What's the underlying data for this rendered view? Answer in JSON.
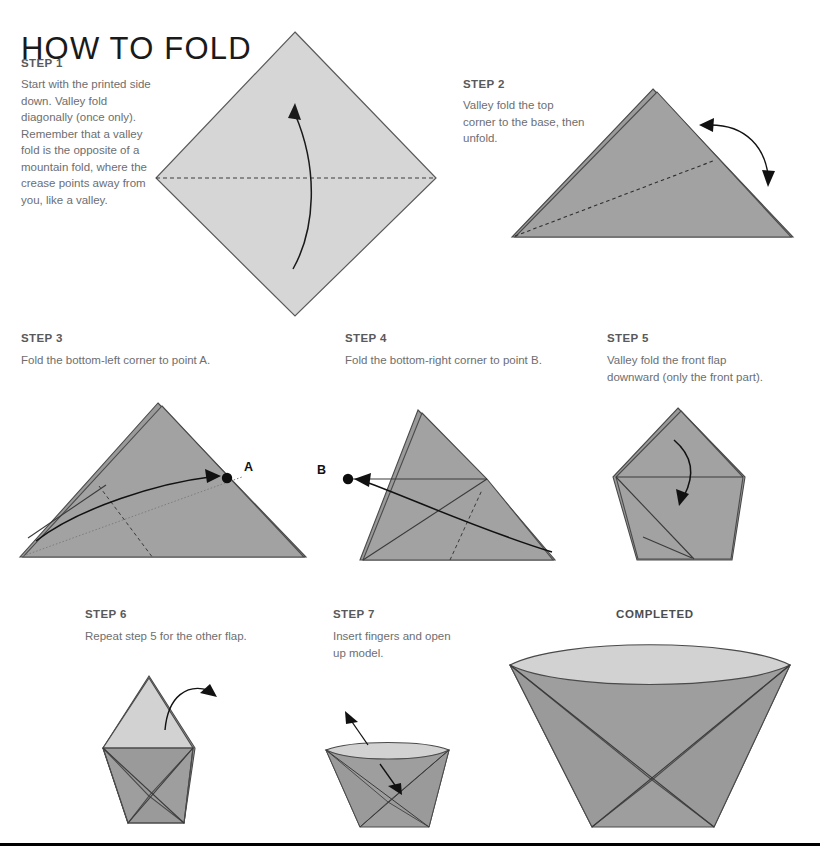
{
  "title": "HOW TO FOLD",
  "steps": [
    {
      "heading": "STEP 1",
      "body": "Start with the printed side down. Valley fold diagonally (once only). Remember that a valley fold is the opposite of a mountain fold, where the crease points away from you, like a valley."
    },
    {
      "heading": "STEP 2",
      "body": "Valley fold the top corner to the base, then unfold."
    },
    {
      "heading": "STEP 3",
      "body": "Fold the bottom-left corner to point A."
    },
    {
      "heading": "STEP 4",
      "body": "Fold the bottom-right corner to point B."
    },
    {
      "heading": "STEP 5",
      "body": "Valley fold the front flap downward (only the front part)."
    },
    {
      "heading": "STEP 6",
      "body": "Repeat step 5 for the other flap."
    },
    {
      "heading": "STEP 7",
      "body": "Insert fingers and open up model."
    }
  ],
  "completed": {
    "heading": "COMPLETED"
  },
  "point_labels": {
    "a": "A",
    "b": "B"
  },
  "colors": {
    "paper_light": "#d6d6d6",
    "paper_mid": "#a2a2a2",
    "paper_dark": "#8f8f8f",
    "paper_shadow": "#9a9a9a",
    "outline": "#4d4d4d",
    "arrow": "#111111",
    "text_body": "#6d6e71",
    "text_head": "#58595b",
    "title": "#1a1a1a",
    "background": "#ffffff"
  }
}
